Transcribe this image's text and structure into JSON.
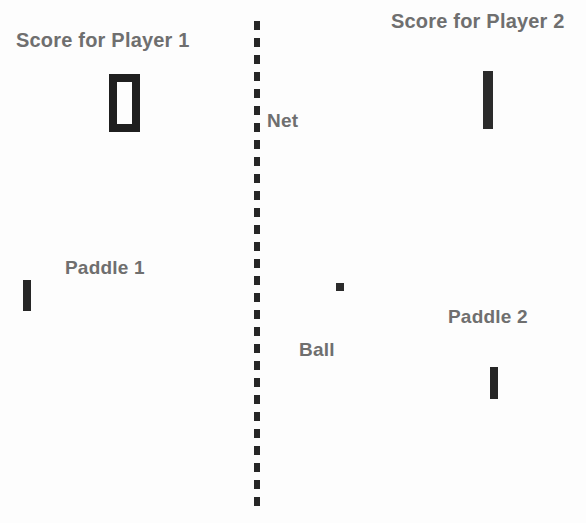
{
  "app": {
    "title": "Pong Game Diagram",
    "background_color": "#fdfdfd",
    "label_color": "#6f6f6f",
    "element_color": "#262626"
  },
  "labels": {
    "score_player1": "Score for Player 1",
    "score_player2": "Score for Player 2",
    "net": "Net",
    "paddle1": "Paddle 1",
    "paddle2": "Paddle 2",
    "ball": "Ball"
  },
  "scores": {
    "player1": "0",
    "player2": "1"
  },
  "elements": {
    "net_name": "net-dashed-line",
    "paddle1_name": "paddle-left",
    "paddle2_name": "paddle-right",
    "ball_name": "ball"
  }
}
